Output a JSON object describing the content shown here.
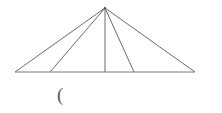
{
  "canvas": {
    "width": 222,
    "height": 113,
    "background": "#ffffff"
  },
  "figure": {
    "name": "fan-of-triangles",
    "stroke_color": "#595959",
    "baseline_color": "#7a7a7a",
    "stroke_width": 0.9,
    "apex": {
      "x": 105,
      "y": 8
    },
    "baseline": {
      "x1": 15,
      "y1": 72,
      "x2": 195,
      "y2": 72
    },
    "base_points": [
      {
        "name": "left-endpoint",
        "x": 15,
        "y": 72
      },
      {
        "name": "foot-1",
        "x": 50,
        "y": 72
      },
      {
        "name": "foot-2",
        "x": 105,
        "y": 72
      },
      {
        "name": "foot-3",
        "x": 134,
        "y": 72
      },
      {
        "name": "right-endpoint",
        "x": 195,
        "y": 72
      }
    ],
    "rays": [
      {
        "name": "ray-to-left-endpoint",
        "to_x": 15,
        "to_y": 72
      },
      {
        "name": "ray-to-foot-1",
        "to_x": 50,
        "to_y": 72
      },
      {
        "name": "ray-to-foot-2",
        "to_x": 105,
        "to_y": 72
      },
      {
        "name": "ray-to-foot-3",
        "to_x": 134,
        "to_y": 72
      },
      {
        "name": "ray-to-right-endpoint",
        "to_x": 195,
        "to_y": 72
      }
    ]
  },
  "annotations": [
    {
      "name": "open-paren-mark",
      "text": "(",
      "x": 57,
      "y": 85,
      "font_size": 19,
      "color": "#5a5a5a"
    }
  ]
}
